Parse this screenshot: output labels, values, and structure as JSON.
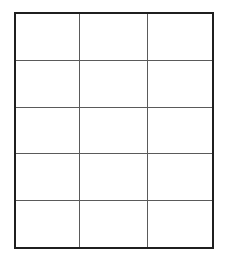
{
  "page": {
    "background_color": "#ffffff",
    "width": 227,
    "height": 265
  },
  "table": {
    "name": "blank-grid",
    "rows": 5,
    "columns": 3,
    "outer_border_color": "#1f1f1f",
    "outer_border_width_px": 2,
    "inner_line_color": "#5a5a5a",
    "inner_line_width_px": 1,
    "cell_background": "#ffffff",
    "has_header_row": false,
    "column_headers": [
      "",
      "",
      ""
    ],
    "cells": [
      [
        "",
        "",
        ""
      ],
      [
        "",
        "",
        ""
      ],
      [
        "",
        "",
        ""
      ],
      [
        "",
        "",
        ""
      ],
      [
        "",
        "",
        ""
      ]
    ]
  }
}
